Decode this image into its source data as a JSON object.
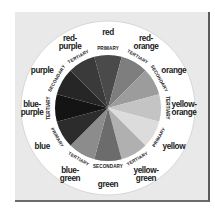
{
  "figure": {
    "center": [
      108,
      108
    ],
    "pie_radius": 53,
    "ring_outer_radius": 87,
    "panel_color": "#e9e9e9",
    "ring_color": "#ffffff"
  },
  "segments": [
    {
      "name": "red",
      "category": "PRIMARY",
      "shade": "#4a4a4a"
    },
    {
      "name": "red-orange",
      "category": "TERTIARY",
      "shade": "#7e7e7e"
    },
    {
      "name": "orange",
      "category": "SECONDARY",
      "shade": "#9c9c9c"
    },
    {
      "name": "yellow-orange",
      "category": "TERTIARY",
      "shade": "#c4c4c4"
    },
    {
      "name": "yellow",
      "category": "PRIMARY",
      "shade": "#dcdcdc"
    },
    {
      "name": "yellow-green",
      "category": "TERTIARY",
      "shade": "#b0b0b0"
    },
    {
      "name": "green",
      "category": "SECONDARY",
      "shade": "#6c6c6c"
    },
    {
      "name": "blue-green",
      "category": "TERTIARY",
      "shade": "#8c8c8c"
    },
    {
      "name": "blue",
      "category": "PRIMARY",
      "shade": "#2c2c2c"
    },
    {
      "name": "blue-purple",
      "category": "TERTIARY",
      "shade": "#141414"
    },
    {
      "name": "purple",
      "category": "SECONDARY",
      "shade": "#262626"
    },
    {
      "name": "red-purple",
      "category": "TERTIARY",
      "shade": "#3a3a3a"
    }
  ],
  "labels": {
    "red": [
      "red"
    ],
    "red-orange": [
      "red-",
      "orange"
    ],
    "orange": [
      "orange"
    ],
    "yellow-orange": [
      "yellow-",
      "orange"
    ],
    "yellow": [
      "yellow"
    ],
    "yellow-green": [
      "yellow-",
      "green"
    ],
    "green": [
      "green"
    ],
    "blue-green": [
      "blue-",
      "green"
    ],
    "blue": [
      "blue"
    ],
    "blue-purple": [
      "blue-",
      "purple"
    ],
    "purple": [
      "purple"
    ],
    "red-purple": [
      "red-",
      "purple"
    ]
  }
}
